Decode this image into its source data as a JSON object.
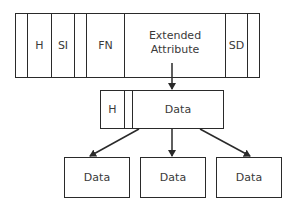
{
  "top_record": {
    "cells": [
      {
        "label": ""
      },
      {
        "label": "H"
      },
      {
        "label": "SI"
      },
      {
        "label": ""
      },
      {
        "label": "FN"
      },
      {
        "label": "Extended Attribute"
      },
      {
        "label": "SD"
      },
      {
        "label": ""
      }
    ]
  },
  "middle_record": {
    "cells": [
      {
        "label": "H"
      },
      {
        "label": ""
      },
      {
        "label": "Data"
      }
    ]
  },
  "bottom_records": [
    {
      "label": "Data"
    },
    {
      "label": "Data"
    },
    {
      "label": "Data"
    }
  ]
}
